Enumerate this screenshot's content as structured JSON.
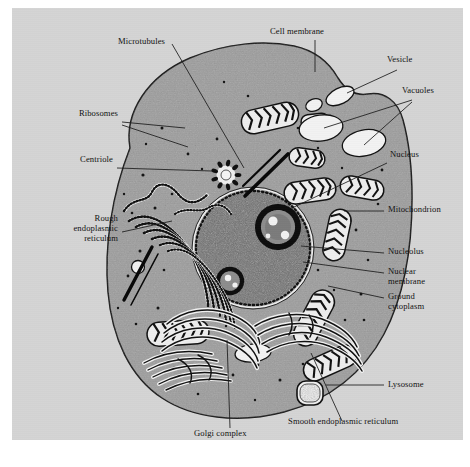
{
  "figure": {
    "type": "labeled biological diagram",
    "background_color": "#ffffff",
    "panel_color": "#d4d4d4",
    "ink_color": "#111111",
    "cytoplasm_color": "#9d9d9d",
    "nucleus_color": "#6f6f6f",
    "organelle_fill": "#e8e8e8"
  },
  "labels": [
    {
      "id": "microtubules",
      "text": "Microtubules"
    },
    {
      "id": "cell-membrane",
      "text": "Cell membrane"
    },
    {
      "id": "vesicle",
      "text": "Vesicle"
    },
    {
      "id": "vacuoles",
      "text": "Vacuoles"
    },
    {
      "id": "ribosomes",
      "text": "Ribosomes"
    },
    {
      "id": "centriole",
      "text": "Centriole"
    },
    {
      "id": "nucleus",
      "text": "Nucleus"
    },
    {
      "id": "mitochondrion",
      "text": "Mitochondrion"
    },
    {
      "id": "rough-er",
      "text": "Rough\nendoplasmic\nreticulum"
    },
    {
      "id": "nucleolus",
      "text": "Nucleolus"
    },
    {
      "id": "nuclear-membrane",
      "text": "Nuclear\nmembrane"
    },
    {
      "id": "ground-cytoplasm",
      "text": "Ground\ncytoplasm"
    },
    {
      "id": "lysosome",
      "text": "Lysosome"
    },
    {
      "id": "golgi-complex",
      "text": "Golgi complex"
    },
    {
      "id": "smooth-er",
      "text": "Smooth endoplasmic reticulum"
    }
  ],
  "structures": [
    "cell membrane",
    "ground cytoplasm",
    "nucleus",
    "nucleolus",
    "nuclear membrane",
    "mitochondrion",
    "rough endoplasmic reticulum",
    "smooth endoplasmic reticulum",
    "golgi complex",
    "lysosome",
    "vacuole",
    "vesicle",
    "centriole",
    "microtubule",
    "ribosome"
  ]
}
